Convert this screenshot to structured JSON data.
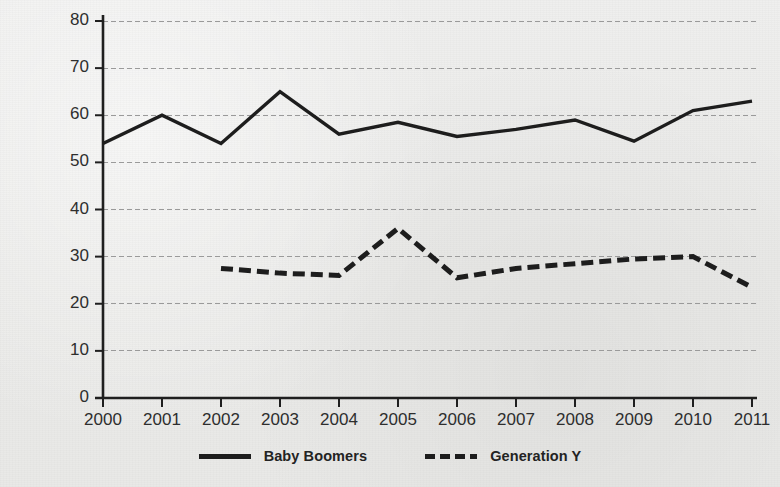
{
  "chart_data": {
    "type": "line",
    "title": "",
    "xlabel": "",
    "ylabel": "% agree",
    "x": [
      2000,
      2001,
      2002,
      2003,
      2004,
      2005,
      2006,
      2007,
      2008,
      2009,
      2010,
      2011
    ],
    "categories": [
      "2000",
      "2001",
      "2002",
      "2003",
      "2004",
      "2005",
      "2006",
      "2007",
      "2008",
      "2009",
      "2010",
      "2011"
    ],
    "xlim": [
      2000,
      2011
    ],
    "ylim": [
      0,
      80
    ],
    "yticks": [
      0,
      10,
      20,
      30,
      40,
      50,
      60,
      70,
      80
    ],
    "ytick_labels": [
      "0",
      "10",
      "20",
      "30",
      "40",
      "50",
      "60",
      "70",
      "80"
    ],
    "grid": "horizontal-dashed",
    "legend_position": "bottom-center",
    "series": [
      {
        "name": "Baby Boomers",
        "style": "solid",
        "color": "#1d1d1d",
        "x": [
          2000,
          2001,
          2002,
          2003,
          2004,
          2005,
          2006,
          2007,
          2008,
          2009,
          2010,
          2011
        ],
        "values": [
          54,
          60,
          54,
          65,
          56,
          58.5,
          55.5,
          57,
          59,
          54.5,
          61,
          63
        ]
      },
      {
        "name": "Generation Y",
        "style": "dashed",
        "color": "#1d1d1d",
        "x": [
          2002,
          2003,
          2004,
          2005,
          2006,
          2007,
          2008,
          2009,
          2010,
          2011
        ],
        "values": [
          27.5,
          26.5,
          26,
          36,
          25.5,
          27.5,
          28.5,
          29.5,
          30,
          23.5
        ]
      }
    ]
  },
  "legend": {
    "items": [
      {
        "label": "Baby Boomers",
        "style": "solid"
      },
      {
        "label": "Generation Y",
        "style": "dashed"
      }
    ]
  }
}
